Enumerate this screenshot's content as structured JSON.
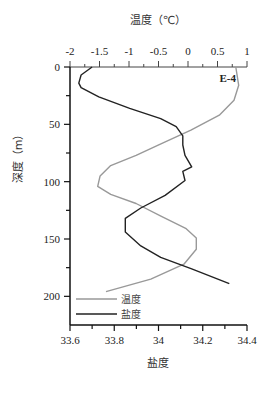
{
  "chart_data": {
    "type": "line",
    "station_label": "E-4",
    "top_axis": {
      "title": "温度（℃）",
      "variable": "temperature",
      "range": [
        -2,
        1
      ],
      "ticks": [
        -2,
        -1.5,
        -1,
        -0.5,
        0,
        0.5,
        1
      ],
      "tick_labels": [
        "-2",
        "-1.5",
        "-1",
        "-0.5",
        "0",
        "0.5",
        "1"
      ]
    },
    "bottom_axis": {
      "title": "盐度",
      "variable": "salinity",
      "range": [
        33.6,
        34.4
      ],
      "ticks": [
        33.6,
        33.8,
        34.0,
        34.2,
        34.4
      ],
      "tick_labels": [
        "33.6",
        "33.8",
        "34",
        "34.2",
        "34.4"
      ]
    },
    "y_axis": {
      "title": "深度（m）",
      "range": [
        0,
        225
      ],
      "inverted": true,
      "ticks": [
        0,
        50,
        100,
        150,
        200
      ],
      "tick_labels": [
        "0",
        "50",
        "100",
        "150",
        "200"
      ]
    },
    "series": [
      {
        "name": "温度",
        "color": "#999999",
        "axis": "top",
        "points": [
          {
            "depth": 0,
            "value": 0.81
          },
          {
            "depth": 16,
            "value": 0.86
          },
          {
            "depth": 29,
            "value": 0.78
          },
          {
            "depth": 42,
            "value": 0.53
          },
          {
            "depth": 55,
            "value": 0.05
          },
          {
            "depth": 67,
            "value": -0.46
          },
          {
            "depth": 77,
            "value": -0.88
          },
          {
            "depth": 86,
            "value": -1.31
          },
          {
            "depth": 95,
            "value": -1.49
          },
          {
            "depth": 104,
            "value": -1.53
          },
          {
            "depth": 111,
            "value": -1.31
          },
          {
            "depth": 119,
            "value": -0.88
          },
          {
            "depth": 130,
            "value": -0.46
          },
          {
            "depth": 141,
            "value": -0.03
          },
          {
            "depth": 149,
            "value": 0.14
          },
          {
            "depth": 159,
            "value": 0.14
          },
          {
            "depth": 172,
            "value": -0.07
          },
          {
            "depth": 185,
            "value": -0.63
          },
          {
            "depth": 196,
            "value": -1.39
          }
        ]
      },
      {
        "name": "盐度",
        "color": "#222222",
        "axis": "bottom",
        "points": [
          {
            "depth": 0,
            "value": 33.7
          },
          {
            "depth": 7,
            "value": 33.65
          },
          {
            "depth": 14,
            "value": 33.64
          },
          {
            "depth": 18,
            "value": 33.65
          },
          {
            "depth": 26,
            "value": 33.73
          },
          {
            "depth": 36,
            "value": 33.87
          },
          {
            "depth": 45,
            "value": 34.01
          },
          {
            "depth": 52,
            "value": 34.08
          },
          {
            "depth": 60,
            "value": 34.11
          },
          {
            "depth": 68,
            "value": 34.11
          },
          {
            "depth": 77,
            "value": 34.12
          },
          {
            "depth": 87,
            "value": 34.15
          },
          {
            "depth": 91,
            "value": 34.11
          },
          {
            "depth": 99,
            "value": 34.12
          },
          {
            "depth": 112,
            "value": 34.03
          },
          {
            "depth": 123,
            "value": 33.92
          },
          {
            "depth": 132,
            "value": 33.85
          },
          {
            "depth": 144,
            "value": 33.85
          },
          {
            "depth": 156,
            "value": 33.92
          },
          {
            "depth": 166,
            "value": 34.01
          },
          {
            "depth": 176,
            "value": 34.15
          },
          {
            "depth": 189,
            "value": 34.32
          }
        ]
      }
    ],
    "legend": {
      "position": "lower-left",
      "entries": [
        {
          "label": "温度",
          "color": "#999999"
        },
        {
          "label": "盐度",
          "color": "#222222"
        }
      ]
    },
    "grid": false
  }
}
